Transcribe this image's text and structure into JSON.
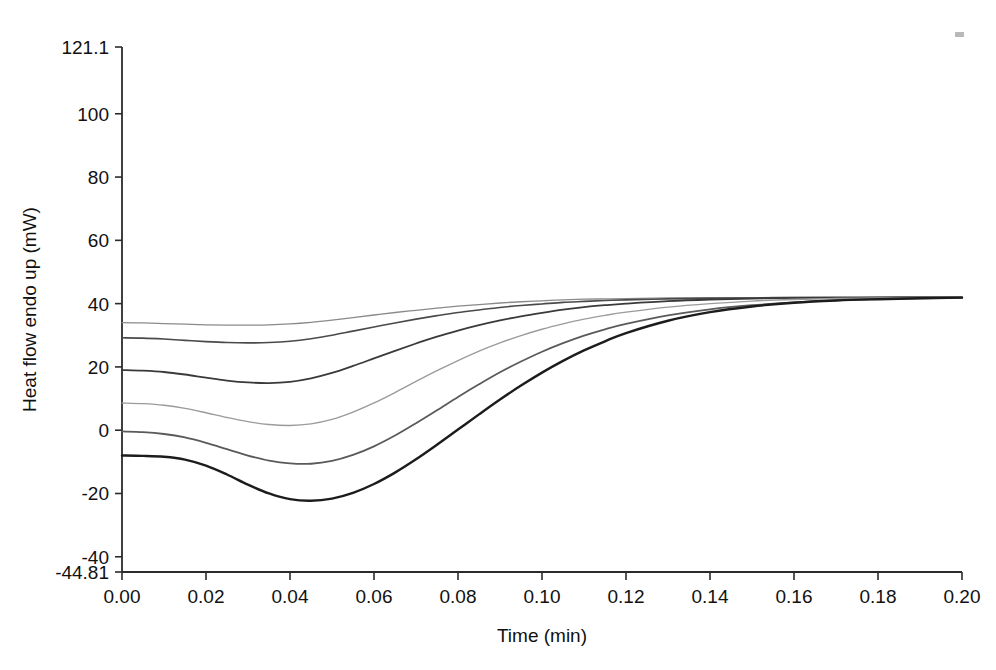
{
  "figure": {
    "background": "#ffffff",
    "axis_color": "#2b2b2b",
    "artifact_label": "scan-speck"
  },
  "chart_data": {
    "type": "line",
    "title": "",
    "xlabel": "Time (min)",
    "ylabel": "Heat flow endo up (mW)",
    "xlim": [
      0.0,
      0.2
    ],
    "ylim": [
      -44.81,
      121.1
    ],
    "grid": false,
    "legend": "none",
    "x_ticks": [
      0.0,
      0.02,
      0.04,
      0.06,
      0.08,
      0.1,
      0.12,
      0.14,
      0.16,
      0.18,
      0.2
    ],
    "x_tick_labels": [
      "0.00",
      "0.02",
      "0.04",
      "0.06",
      "0.08",
      "0.10",
      "0.12",
      "0.14",
      "0.16",
      "0.18",
      "0.20"
    ],
    "y_ticks": [
      -44.81,
      -40,
      -20,
      0,
      20,
      40,
      60,
      80,
      100,
      121.1
    ],
    "y_tick_labels": [
      "-44.81",
      "-40",
      "-20",
      "0",
      "20",
      "40",
      "60",
      "80",
      "100",
      "121.1"
    ],
    "y_axis_min_label": "-44.81",
    "y_axis_max_label": "121.1",
    "converge_value": 42,
    "x": [
      0.0,
      0.005,
      0.01,
      0.015,
      0.02,
      0.025,
      0.03,
      0.035,
      0.04,
      0.045,
      0.05,
      0.055,
      0.06,
      0.065,
      0.07,
      0.075,
      0.08,
      0.085,
      0.09,
      0.095,
      0.1,
      0.105,
      0.11,
      0.115,
      0.12,
      0.13,
      0.14,
      0.15,
      0.16,
      0.17,
      0.18,
      0.19,
      0.2
    ],
    "series": [
      {
        "name": "curve-1",
        "color": "#8a8a8a",
        "width": 1.3,
        "values": [
          34.0,
          33.9,
          33.7,
          33.5,
          33.3,
          33.2,
          33.2,
          33.3,
          33.6,
          34.1,
          34.8,
          35.6,
          36.4,
          37.2,
          37.9,
          38.6,
          39.2,
          39.7,
          40.2,
          40.6,
          40.9,
          41.2,
          41.4,
          41.5,
          41.6,
          41.8,
          41.9,
          41.9,
          42.0,
          42.0,
          42.0,
          42.0,
          42.0
        ]
      },
      {
        "name": "curve-2",
        "color": "#4a4a4a",
        "width": 1.6,
        "values": [
          29.2,
          29.1,
          28.8,
          28.4,
          28.0,
          27.7,
          27.6,
          27.7,
          28.1,
          28.9,
          30.0,
          31.3,
          32.6,
          33.9,
          35.1,
          36.2,
          37.2,
          38.0,
          38.8,
          39.4,
          39.9,
          40.4,
          40.7,
          41.0,
          41.2,
          41.5,
          41.7,
          41.8,
          41.9,
          41.9,
          42.0,
          42.0,
          42.0
        ]
      },
      {
        "name": "curve-3",
        "color": "#3a3a3a",
        "width": 1.8,
        "values": [
          19.0,
          18.8,
          18.4,
          17.6,
          16.6,
          15.7,
          15.1,
          14.9,
          15.3,
          16.4,
          18.1,
          20.3,
          22.7,
          25.1,
          27.4,
          29.6,
          31.5,
          33.2,
          34.7,
          36.0,
          37.1,
          38.1,
          38.9,
          39.5,
          40.0,
          40.8,
          41.3,
          41.6,
          41.8,
          41.9,
          41.9,
          42.0,
          42.0
        ]
      },
      {
        "name": "curve-4",
        "color": "#9b9b9b",
        "width": 1.4,
        "values": [
          8.6,
          8.4,
          7.9,
          6.9,
          5.5,
          4.0,
          2.7,
          1.8,
          1.5,
          2.0,
          3.4,
          5.7,
          8.6,
          11.9,
          15.4,
          18.8,
          22.0,
          25.0,
          27.6,
          29.9,
          31.9,
          33.6,
          35.1,
          36.3,
          37.3,
          38.9,
          40.0,
          40.8,
          41.3,
          41.6,
          41.8,
          41.9,
          42.0
        ]
      },
      {
        "name": "curve-5",
        "color": "#5a5a5a",
        "width": 1.8,
        "values": [
          -0.4,
          -0.6,
          -1.2,
          -2.3,
          -4.0,
          -6.0,
          -8.0,
          -9.6,
          -10.5,
          -10.6,
          -9.7,
          -7.8,
          -5.1,
          -1.7,
          2.2,
          6.3,
          10.5,
          14.5,
          18.3,
          21.7,
          24.8,
          27.5,
          29.9,
          31.9,
          33.6,
          36.3,
          38.2,
          39.5,
          40.4,
          41.0,
          41.4,
          41.7,
          41.9
        ]
      },
      {
        "name": "curve-6",
        "color": "#1c1c1c",
        "width": 2.4,
        "values": [
          -8.0,
          -8.1,
          -8.4,
          -9.3,
          -11.2,
          -14.0,
          -17.2,
          -20.0,
          -21.8,
          -22.3,
          -21.6,
          -19.8,
          -17.0,
          -13.4,
          -9.2,
          -4.6,
          0.2,
          5.0,
          9.7,
          14.1,
          18.2,
          21.9,
          25.2,
          28.1,
          30.7,
          34.6,
          37.3,
          39.1,
          40.3,
          41.0,
          41.4,
          41.7,
          41.9
        ]
      }
    ]
  }
}
